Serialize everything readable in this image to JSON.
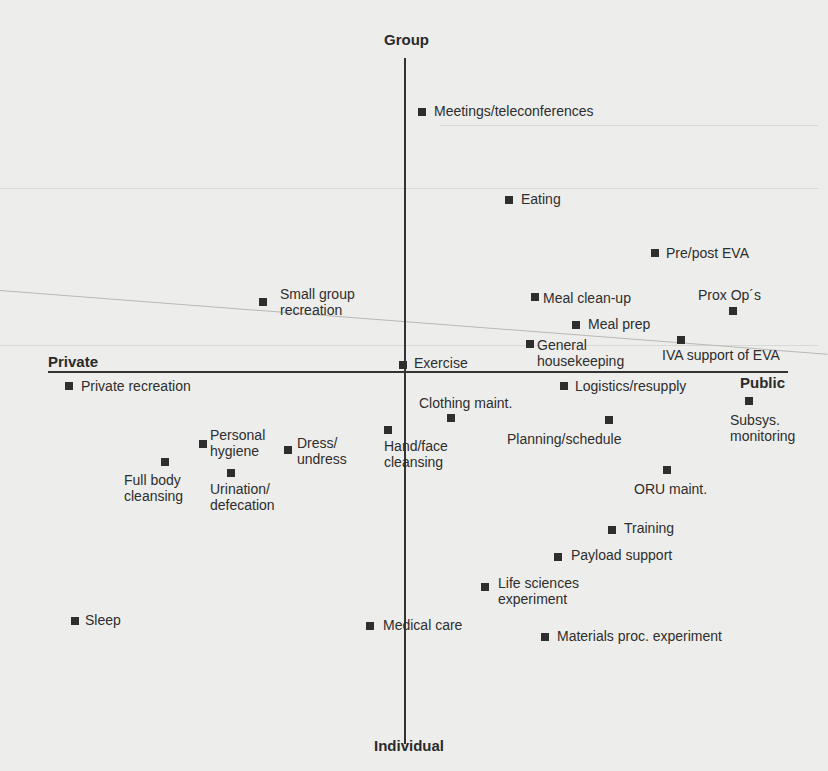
{
  "diagram": {
    "axes": {
      "top": "Group",
      "bottom": "Individual",
      "left": "Private",
      "right": "Public"
    },
    "points": [
      {
        "label": "Meetings/teleconferences",
        "quadrant": "group-public"
      },
      {
        "label": "Eating",
        "quadrant": "group-public"
      },
      {
        "label": "Pre/post EVA",
        "quadrant": "group-public"
      },
      {
        "label": "Small group\nrecreation",
        "quadrant": "group-private"
      },
      {
        "label": "Meal clean-up",
        "quadrant": "group-public"
      },
      {
        "label": "Prox Op´s",
        "quadrant": "group-public"
      },
      {
        "label": "Meal prep",
        "quadrant": "group-public"
      },
      {
        "label": "General\nhousekeeping",
        "quadrant": "group-public"
      },
      {
        "label": "IVA support of EVA",
        "quadrant": "group-public"
      },
      {
        "label": "Exercise",
        "quadrant": "center"
      },
      {
        "label": "Private recreation",
        "quadrant": "individual-private"
      },
      {
        "label": "Logistics/resupply",
        "quadrant": "individual-public"
      },
      {
        "label": "Clothing maint.",
        "quadrant": "individual-public"
      },
      {
        "label": "Subsys.\nmonitoring",
        "quadrant": "individual-public"
      },
      {
        "label": "Planning/schedule",
        "quadrant": "individual-public"
      },
      {
        "label": "Hand/face\ncleansing",
        "quadrant": "individual-private"
      },
      {
        "label": "Personal\nhygiene",
        "quadrant": "individual-private"
      },
      {
        "label": "Dress/\nundress",
        "quadrant": "individual-private"
      },
      {
        "label": "ORU maint.",
        "quadrant": "individual-public"
      },
      {
        "label": "Full body\ncleansing",
        "quadrant": "individual-private"
      },
      {
        "label": "Urination/\ndefecation",
        "quadrant": "individual-private"
      },
      {
        "label": "Training",
        "quadrant": "individual-public"
      },
      {
        "label": "Payload support",
        "quadrant": "individual-public"
      },
      {
        "label": "Life sciences\nexperiment",
        "quadrant": "individual-public"
      },
      {
        "label": "Sleep",
        "quadrant": "individual-private"
      },
      {
        "label": "Medical care",
        "quadrant": "individual-private"
      },
      {
        "label": "Materials proc. experiment",
        "quadrant": "individual-public"
      }
    ]
  }
}
